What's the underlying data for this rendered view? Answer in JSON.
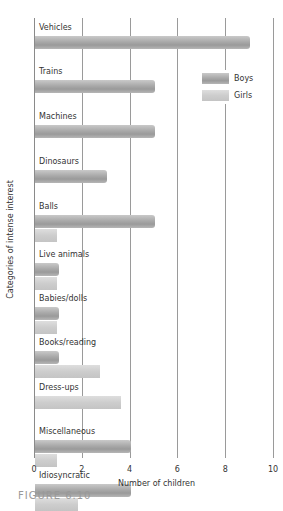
{
  "chart_data": {
    "type": "bar",
    "orientation": "horizontal",
    "title": "",
    "xlabel": "Number of children",
    "ylabel": "Categories of intense interest",
    "xlim": [
      0,
      10
    ],
    "x_ticks": [
      "0",
      "2",
      "4",
      "6",
      "8",
      "10"
    ],
    "grid": "vertical",
    "legend_position": "upper right",
    "categories": [
      "Vehicles",
      "Trains",
      "Machines",
      "Dinosaurs",
      "Balls",
      "Live animals",
      "Babies/dolls",
      "Books/reading",
      "Dress-ups",
      "Miscellaneous",
      "Idiosyncratic"
    ],
    "series": [
      {
        "name": "Boys",
        "color": "#a8a8a8",
        "values": [
          9,
          5,
          5,
          3,
          5,
          1,
          1,
          1,
          0,
          4,
          4
        ]
      },
      {
        "name": "Girls",
        "color": "#cfcfcf",
        "values": [
          0,
          0,
          0,
          0,
          1,
          1,
          1,
          3,
          4,
          1,
          2
        ]
      }
    ]
  },
  "legend": {
    "boys": "Boys",
    "girls": "Girls"
  },
  "caption": "FIGURE 6.10"
}
